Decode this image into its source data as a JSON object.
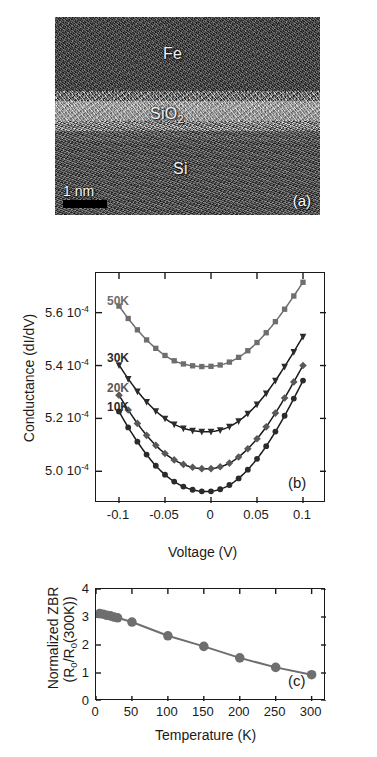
{
  "figure": {
    "panels": [
      "a",
      "b",
      "c"
    ]
  },
  "panel_a": {
    "tag": "(a)",
    "type": "tem-micrograph",
    "layers": [
      {
        "name": "Fe",
        "label": "Fe"
      },
      {
        "name": "SiO2",
        "label": "SiO",
        "subscript": "2"
      },
      {
        "name": "Si",
        "label": "Si"
      }
    ],
    "scale_bar": {
      "label": "1 nm",
      "length_px": 44,
      "color": "#000000"
    }
  },
  "chart_data": [
    {
      "panel": "b",
      "type": "line",
      "tag": "(b)",
      "title": "",
      "xlabel": "Voltage (V)",
      "ylabel": "Conductance (dI/dV)",
      "xlim": [
        -0.125,
        0.125
      ],
      "ylim": [
        0.000488,
        0.000575
      ],
      "xticks": [
        -0.1,
        -0.05,
        0,
        0.05,
        0.1
      ],
      "xticklabels": [
        "-0.1",
        "-0.05",
        "0",
        "0.05",
        "0.1"
      ],
      "yticks": [
        0.0005,
        0.00052,
        0.00054,
        0.00056
      ],
      "yticklabels": [
        "5.0 10",
        "5.2 10",
        "5.4 10",
        "5.6 10"
      ],
      "ytick_exponent": "-4",
      "grid": false,
      "legend_position": "inside-upper-left",
      "series": [
        {
          "name": "50K",
          "label": "50K",
          "marker": "square",
          "color": "#6e6e6e",
          "line_color": "#6e6e6e",
          "x": [
            -0.1,
            -0.09,
            -0.08,
            -0.07,
            -0.06,
            -0.05,
            -0.04,
            -0.03,
            -0.02,
            -0.01,
            0.0,
            0.01,
            0.02,
            0.03,
            0.04,
            0.05,
            0.06,
            0.07,
            0.08,
            0.09,
            0.1
          ],
          "y": [
            0.0005625,
            0.0005578,
            0.0005535,
            0.0005497,
            0.0005465,
            0.0005438,
            0.0005418,
            0.0005406,
            0.0005399,
            0.0005396,
            0.0005397,
            0.0005402,
            0.0005413,
            0.0005431,
            0.0005456,
            0.0005487,
            0.0005524,
            0.0005566,
            0.0005613,
            0.0005663,
            0.0005715
          ]
        },
        {
          "name": "30K",
          "label": "30K",
          "marker": "triangle-down",
          "color": "#2b2b2b",
          "line_color": "#1a1a1a",
          "x": [
            -0.1,
            -0.09,
            -0.08,
            -0.07,
            -0.06,
            -0.05,
            -0.04,
            -0.03,
            -0.02,
            -0.01,
            0.0,
            0.01,
            0.02,
            0.03,
            0.04,
            0.05,
            0.06,
            0.07,
            0.08,
            0.09,
            0.1
          ],
          "y": [
            0.0005402,
            0.000535,
            0.0005303,
            0.0005263,
            0.0005228,
            0.00052,
            0.0005178,
            0.0005163,
            0.0005154,
            0.000515,
            0.000515,
            0.0005156,
            0.0005169,
            0.000519,
            0.0005218,
            0.0005253,
            0.0005295,
            0.0005343,
            0.0005396,
            0.0005452,
            0.000551
          ]
        },
        {
          "name": "20K",
          "label": "20K",
          "marker": "diamond",
          "color": "#595959",
          "line_color": "#1a1a1a",
          "x": [
            -0.1,
            -0.09,
            -0.08,
            -0.07,
            -0.06,
            -0.05,
            -0.04,
            -0.03,
            -0.02,
            -0.01,
            0.0,
            0.01,
            0.02,
            0.03,
            0.04,
            0.05,
            0.06,
            0.07,
            0.08,
            0.09,
            0.1
          ],
          "y": [
            0.0005288,
            0.0005232,
            0.0005181,
            0.0005136,
            0.0005098,
            0.0005067,
            0.0005043,
            0.0005026,
            0.0005015,
            0.000501,
            0.000501,
            0.0005017,
            0.0005031,
            0.0005054,
            0.0005085,
            0.0005123,
            0.0005168,
            0.000522,
            0.0005277,
            0.0005338,
            0.00054
          ]
        },
        {
          "name": "10K",
          "label": "10K",
          "marker": "circle",
          "color": "#2b2b2b",
          "line_color": "#1a1a1a",
          "x": [
            -0.1,
            -0.09,
            -0.08,
            -0.07,
            -0.06,
            -0.05,
            -0.04,
            -0.03,
            -0.02,
            -0.01,
            0.0,
            0.01,
            0.02,
            0.03,
            0.04,
            0.05,
            0.06,
            0.07,
            0.08,
            0.09,
            0.1
          ],
          "y": [
            0.0005226,
            0.0005166,
            0.0005112,
            0.0005063,
            0.0005021,
            0.0004987,
            0.0004961,
            0.0004942,
            0.000493,
            0.0004924,
            0.0004924,
            0.0004932,
            0.0004948,
            0.0004973,
            0.0005006,
            0.0005047,
            0.0005095,
            0.000515,
            0.000521,
            0.0005275,
            0.0005343
          ]
        }
      ]
    },
    {
      "panel": "c",
      "type": "line",
      "tag": "(c)",
      "title": "",
      "xlabel": "Temperature (K)",
      "ylabel_line1": "Normalized ZBR",
      "ylabel_line2": "(R0/R0(300K))",
      "ylabel_line2_parts": {
        "prefix": "(R",
        "sub1": "0",
        "mid": "/R",
        "sub2": "0",
        "suffix": "(300K))"
      },
      "xlim": [
        0,
        320
      ],
      "ylim": [
        0,
        4
      ],
      "xticks": [
        0,
        50,
        100,
        150,
        200,
        250,
        300
      ],
      "xticklabels": [
        "0",
        "50",
        "100",
        "150",
        "200",
        "250",
        "300"
      ],
      "yticks": [
        0,
        1,
        2,
        3,
        4
      ],
      "yticklabels": [
        "0",
        "1",
        "2",
        "3",
        "4"
      ],
      "grid": false,
      "legend_position": "none",
      "series": [
        {
          "name": "normalized-zbr",
          "marker": "circle",
          "color": "#6e6e6e",
          "line_color": "#6e6e6e",
          "x": [
            5,
            10,
            15,
            20,
            25,
            30,
            50,
            100,
            150,
            200,
            250,
            300
          ],
          "y": [
            3.12,
            3.1,
            3.06,
            3.04,
            3.0,
            2.97,
            2.82,
            2.33,
            1.95,
            1.54,
            1.2,
            0.94
          ]
        }
      ]
    }
  ]
}
